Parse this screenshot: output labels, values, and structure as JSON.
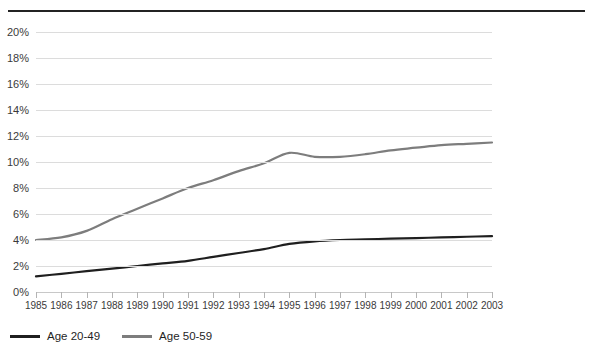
{
  "chart_data": {
    "type": "line",
    "title": "",
    "subtitle": "",
    "xlabel": "",
    "ylabel": "",
    "grid": true,
    "legend_position": "bottom-left",
    "x": [
      1985,
      1986,
      1987,
      1988,
      1989,
      1990,
      1991,
      1992,
      1993,
      1994,
      1995,
      1996,
      1997,
      1998,
      1999,
      2000,
      2001,
      2002,
      2003
    ],
    "categories": [
      "1985",
      "1986",
      "1987",
      "1988",
      "1989",
      "1990",
      "1991",
      "1992",
      "1993",
      "1994",
      "1995",
      "1996",
      "1997",
      "1998",
      "1999",
      "2000",
      "2001",
      "2002",
      "2003"
    ],
    "ylim": [
      0,
      20
    ],
    "ytick_values": [
      0,
      2,
      4,
      6,
      8,
      10,
      12,
      14,
      16,
      18,
      20
    ],
    "ytick_labels": [
      "0%",
      "2%",
      "4%",
      "6%",
      "8%",
      "10%",
      "12%",
      "14%",
      "16%",
      "18%",
      "20%"
    ],
    "series": [
      {
        "name": "Age 20-49",
        "color": "#1f1f1f",
        "values": [
          1.2,
          1.4,
          1.6,
          1.8,
          2.0,
          2.2,
          2.4,
          2.7,
          3.0,
          3.3,
          3.7,
          3.9,
          4.0,
          4.05,
          4.1,
          4.15,
          4.2,
          4.25,
          4.3
        ]
      },
      {
        "name": "Age 50-59",
        "color": "#7d7d7d",
        "values": [
          4.0,
          4.2,
          4.7,
          5.6,
          6.4,
          7.2,
          8.0,
          8.6,
          9.3,
          9.9,
          10.7,
          10.4,
          10.4,
          10.6,
          10.9,
          11.1,
          11.3,
          11.4,
          11.5
        ]
      }
    ]
  },
  "legend": {
    "items": [
      {
        "label": "Age 20-49",
        "color": "#1f1f1f"
      },
      {
        "label": "Age 50-59",
        "color": "#7d7d7d"
      }
    ]
  }
}
